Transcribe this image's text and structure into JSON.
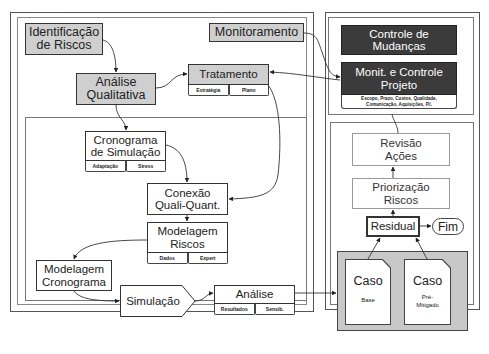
{
  "diagram": {
    "type": "risk-management-process-flow",
    "language": "pt-BR"
  },
  "nodes": {
    "identificacao": {
      "label": "Identificação de Riscos",
      "line1": "Identificação",
      "line2": "de Riscos"
    },
    "monitoramento": {
      "label": "Monitoramento"
    },
    "analise_qualitativa": {
      "line1": "Análise",
      "line2": "Qualitativa"
    },
    "tratamento": {
      "label": "Tratamento",
      "sub": [
        "Estratégia",
        "Plano"
      ]
    },
    "controle_mudancas": {
      "line1": "Controle de",
      "line2": "Mudanças"
    },
    "monit_controle_projeto": {
      "line1": "Monit. e Controle",
      "line2": "Projeto",
      "scope_line1": "Escopo, Prazo, Custos, Qualidade,",
      "scope_line2": "Comunicação, Aquisições, P.I."
    },
    "cronograma_simulacao": {
      "line1": "Cronograma",
      "line2": "de Simulação",
      "sub": [
        "Adaptação",
        "Stress"
      ]
    },
    "conexao": {
      "line1": "Conexão",
      "line2": "Quali-Quant."
    },
    "modelagem_riscos": {
      "line1": "Modelagem",
      "line2": "Riscos",
      "sub": [
        "Dados",
        "Expert"
      ]
    },
    "modelagem_cronograma": {
      "line1": "Modelagem",
      "line2": "Cronograma"
    },
    "simulacao": {
      "label": "Simulação"
    },
    "analise": {
      "label": "Análise",
      "sub": [
        "Resultados",
        "Sensib."
      ]
    },
    "revisao_acoes": {
      "line1": "Revisão",
      "line2": "Ações"
    },
    "priorizacao_riscos": {
      "line1": "Priorização",
      "line2": "Riscos"
    },
    "residual": {
      "label": "Residual"
    },
    "fim": {
      "label": "Fim"
    },
    "caso_base": {
      "title": "Caso",
      "sub": "Base"
    },
    "caso_pre_mitigado": {
      "title": "Caso",
      "sub_line1": "Pré-",
      "sub_line2": "Mitigado"
    }
  },
  "edges": [
    {
      "from": "Identificação de Riscos",
      "to": "Análise Qualitativa"
    },
    {
      "from": "Análise Qualitativa",
      "to": "Tratamento"
    },
    {
      "from": "Análise Qualitativa",
      "to": "Cronograma de Simulação"
    },
    {
      "from": "Monitoramento",
      "to": "Monit. e Controle Projeto"
    },
    {
      "from": "Monit. e Controle Projeto",
      "to": "Tratamento"
    },
    {
      "from": "Tratamento",
      "to": "Conexão Quali-Quant."
    },
    {
      "from": "Cronograma de Simulação",
      "to": "Conexão Quali-Quant."
    },
    {
      "from": "Conexão Quali-Quant.",
      "to": "Modelagem Riscos"
    },
    {
      "from": "Modelagem Riscos",
      "to": "Modelagem Cronograma"
    },
    {
      "from": "Modelagem Cronograma",
      "to": "Simulação"
    },
    {
      "from": "Simulação",
      "to": "Análise"
    },
    {
      "from": "Análise",
      "to": "Caso group"
    },
    {
      "from": "Caso Base",
      "to": "Residual"
    },
    {
      "from": "Caso Pré-Mitigado",
      "to": "Residual"
    },
    {
      "from": "Residual",
      "to": "Fim"
    },
    {
      "from": "Residual",
      "to": "Priorização Riscos"
    },
    {
      "from": "Priorização Riscos",
      "to": "Revisão Ações"
    },
    {
      "from": "Revisão Ações",
      "to": "Monit. e Controle Projeto"
    }
  ],
  "colors": {
    "gray_box": "#cfcfcf",
    "dark_box": "#3b3b3b",
    "caso_group_bg": "#c8c8c8",
    "line": "#333333"
  }
}
